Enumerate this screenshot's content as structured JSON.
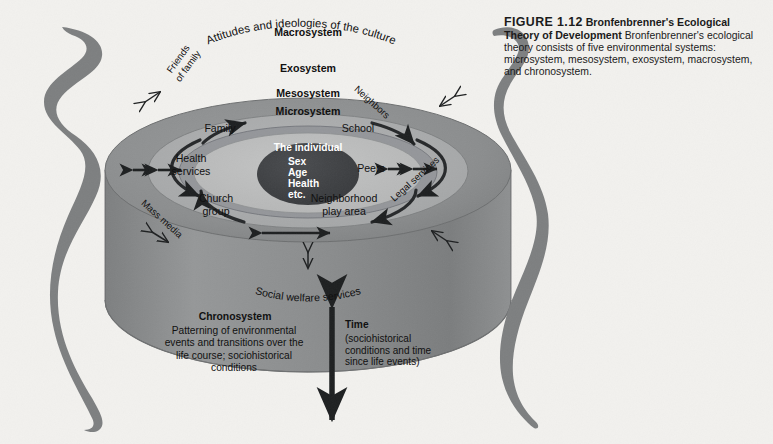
{
  "figure": {
    "number_label": "FIGURE 1.12",
    "title": "Bronfenbrenner's Ecological Theory of Development",
    "body": "Bronfenbrenner's ecological theory consists of five environmental systems: microsystem, mesosystem, exosystem, macrosystem, and chronosystem."
  },
  "diagram": {
    "type": "concentric-rings-cylinder",
    "systems": [
      {
        "key": "macrosystem",
        "label": "Macrosystem",
        "subtitle": "Attitudes and ideologies of the culture"
      },
      {
        "key": "exosystem",
        "label": "Exosystem",
        "subtitle": ""
      },
      {
        "key": "mesosystem",
        "label": "Mesosystem",
        "subtitle": ""
      },
      {
        "key": "microsystem",
        "label": "Microsystem",
        "subtitle": ""
      }
    ],
    "center": {
      "heading": "The individual",
      "attributes": [
        "Sex",
        "Age",
        "Health",
        "etc."
      ]
    },
    "microsystem_items": [
      {
        "key": "family",
        "label": "Family"
      },
      {
        "key": "school",
        "label": "School"
      },
      {
        "key": "health-services",
        "label": "Health\nservices"
      },
      {
        "key": "peers",
        "label": "Peers"
      },
      {
        "key": "church-group",
        "label": "Church\ngroup"
      },
      {
        "key": "neighborhood-play",
        "label": "Neighborhood\nplay area"
      }
    ],
    "exosystem_items": [
      {
        "key": "friends-of-family",
        "label": "Friends\nof family"
      },
      {
        "key": "neighbors",
        "label": "Neighbors"
      },
      {
        "key": "mass-media",
        "label": "Mass media"
      },
      {
        "key": "legal-services",
        "label": "Legal services"
      },
      {
        "key": "social-welfare",
        "label": "Social welfare services"
      }
    ],
    "chronosystem": {
      "heading": "Chronosystem",
      "body": "Patterning of environmental\nevents and transitions over the\nlife course; sociohistorical\nconditions"
    },
    "time": {
      "heading": "Time",
      "body": "(sociohistorical\nconditions and time\nsince life events)"
    },
    "colors": {
      "background": "#f2f1ee",
      "macrosystem_ring": "#8d8f90",
      "exosystem_ring": "#a9aaab",
      "mesosystem_ring": "#8f9193",
      "microsystem_disc": "#bcbdbd",
      "individual_core": "#3f4144",
      "cylinder_side": "#8a8c8d",
      "ribbon": "#7d7f80",
      "text": "#111111"
    }
  }
}
